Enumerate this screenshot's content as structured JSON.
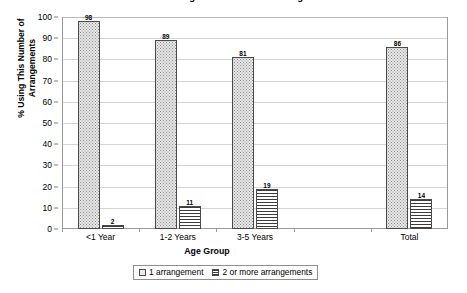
{
  "chart_data": {
    "type": "bar",
    "title": "Percent Using This Number of Arrangements",
    "xlabel": "Age Group",
    "ylabel": "% Using This Number of Arrangements",
    "ylabel_line1": "% Using This Number of",
    "ylabel_line2": "Arrangements",
    "categories": [
      "<1 Year",
      "1-2 Years",
      "3-5 Years",
      "",
      "Total"
    ],
    "series": [
      {
        "name": "1 arrangement",
        "values": [
          98,
          89,
          81,
          null,
          86
        ],
        "fill": "stipple-dots",
        "color": "#e8e8e8"
      },
      {
        "name": "2 or more arrangements",
        "values": [
          2,
          11,
          19,
          null,
          14
        ],
        "fill": "horizontal-hatch",
        "color": "#ffffff"
      }
    ],
    "ylim": [
      0,
      100
    ],
    "yticks": [
      0,
      10,
      20,
      30,
      40,
      50,
      60,
      70,
      80,
      90,
      100
    ],
    "ytick_labels": [
      "0",
      "10",
      "20",
      "30",
      "40",
      "50",
      "60",
      "70",
      "80",
      "90",
      "100"
    ],
    "grid": true,
    "grid_axis": "y",
    "legend_position": "bottom",
    "legend_items": [
      "1 arrangement",
      "2 or more arrangements"
    ],
    "data_labels": {
      "series1": [
        "98",
        "89",
        "81",
        "",
        "86"
      ],
      "series2": [
        "2",
        "11",
        "19",
        "",
        "14"
      ]
    }
  },
  "colors": {
    "frame": "#9a9a9a",
    "gridline": "#d4d4d4",
    "bar_border": "#4a4a4a",
    "text": "#000000",
    "background": "#ffffff"
  }
}
